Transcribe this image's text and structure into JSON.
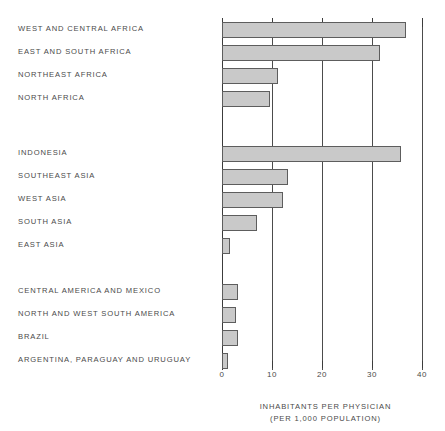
{
  "chart_data": {
    "type": "bar",
    "orientation": "horizontal",
    "title": "",
    "xlabel": "INHABITANTS PER PHYSICIAN",
    "xlabel_sub": "(PER 1,000 POPULATION)",
    "ylabel": "",
    "xlim": [
      0,
      40
    ],
    "xticks": [
      0,
      10,
      20,
      30,
      40
    ],
    "xtick_labels": [
      "0",
      "10",
      "20",
      "30",
      "40"
    ],
    "grid": true,
    "legend": "none",
    "bar_fill_color": "#c9c9c9",
    "bar_edge_color": "#5d5d5d",
    "axis_color": "#3c3c3c",
    "groups": [
      {
        "name": "Africa",
        "categories": [
          "WEST AND CENTRAL AFRICA",
          "EAST AND SOUTH AFRICA",
          "NORTHEAST AFRICA",
          "NORTH AFRICA"
        ],
        "values": [
          36.8,
          31.6,
          11.2,
          9.6
        ]
      },
      {
        "name": "Asia",
        "categories": [
          "INDONESIA",
          "SOUTHEAST ASIA",
          "WEST ASIA",
          "SOUTH ASIA",
          "EAST ASIA"
        ],
        "values": [
          35.8,
          13.2,
          12.2,
          7.0,
          1.6
        ]
      },
      {
        "name": "Latin America",
        "categories": [
          "CENTRAL AMERICA AND MEXICO",
          "NORTH AND WEST SOUTH AMERICA",
          "BRAZIL",
          "ARGENTINA, PARAGUAY AND URUGUAY"
        ],
        "values": [
          3.2,
          2.8,
          3.2,
          1.2
        ]
      }
    ],
    "categories": [
      "WEST AND CENTRAL AFRICA",
      "EAST AND SOUTH AFRICA",
      "NORTHEAST AFRICA",
      "NORTH AFRICA",
      "INDONESIA",
      "SOUTHEAST ASIA",
      "WEST ASIA",
      "SOUTH ASIA",
      "EAST ASIA",
      "CENTRAL AMERICA AND MEXICO",
      "NORTH AND WEST SOUTH AMERICA",
      "BRAZIL",
      "ARGENTINA, PARAGUAY AND URUGUAY"
    ],
    "values": [
      36.8,
      31.6,
      11.2,
      9.6,
      35.8,
      13.2,
      12.2,
      7.0,
      1.6,
      3.2,
      2.8,
      3.2,
      1.2
    ]
  }
}
